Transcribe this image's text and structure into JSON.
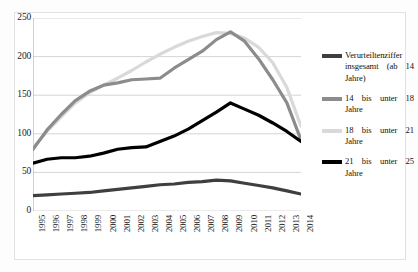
{
  "chart_data": {
    "type": "line",
    "title": "",
    "subtitle": "",
    "xlabel": "",
    "ylabel": "",
    "x": [
      1995,
      1996,
      1997,
      1998,
      1999,
      2000,
      2001,
      2002,
      2003,
      2004,
      2005,
      2006,
      2007,
      2008,
      2009,
      2010,
      2011,
      2012,
      2013,
      2014
    ],
    "categories": [
      "1995",
      "1996",
      "1997",
      "1998",
      "1999",
      "2000",
      "2001",
      "2002",
      "2003",
      "2004",
      "2005",
      "2006",
      "2007",
      "2008",
      "2009",
      "2010",
      "2011",
      "2012",
      "2013",
      "2014"
    ],
    "xlim": [
      1995,
      2014
    ],
    "ylim": [
      0,
      250
    ],
    "yticks": [
      0,
      50,
      100,
      150,
      200,
      250
    ],
    "ytick_labels": [
      "0",
      "50",
      "100",
      "150",
      "200",
      "250"
    ],
    "grid": "horizontal",
    "legend_position": "right",
    "series": [
      {
        "name": "Verurteiltenziffer insgesamt (ab 14 Jahre)",
        "color": "#3f3f3f",
        "width": 3.2,
        "values": [
          20,
          21,
          22,
          23,
          24,
          26,
          28,
          30,
          32,
          34,
          35,
          37,
          38,
          40,
          39,
          36,
          33,
          30,
          26,
          22
        ]
      },
      {
        "name": "14 bis unter 18 Jahre",
        "color": "#8c8c8c",
        "width": 3.2,
        "values": [
          80,
          105,
          125,
          143,
          155,
          163,
          166,
          170,
          171,
          172,
          185,
          196,
          207,
          222,
          232,
          220,
          197,
          170,
          140,
          92
        ]
      },
      {
        "name": "18 bis unter 21 Jahre",
        "color": "#d9d9d9",
        "width": 3.2,
        "values": [
          82,
          103,
          122,
          140,
          153,
          163,
          172,
          182,
          193,
          203,
          212,
          220,
          226,
          231,
          230,
          224,
          212,
          192,
          160,
          110
        ]
      },
      {
        "name": "21 bis unter 25 Jahre",
        "color": "#000000",
        "width": 3.2,
        "values": [
          62,
          67,
          69,
          69,
          71,
          75,
          80,
          82,
          83,
          90,
          97,
          106,
          117,
          128,
          140,
          132,
          124,
          114,
          103,
          90
        ]
      }
    ]
  },
  "legend": {
    "entries": [
      {
        "label": "Verurteiltenziffer insgesamt (ab 14 Jahre)",
        "swatch": "#3f3f3f"
      },
      {
        "label": "14 bis unter 18 Jahre",
        "swatch": "#8c8c8c"
      },
      {
        "label": "18 bis unter 21 Jahre",
        "swatch": "#d9d9d9"
      },
      {
        "label": "21 bis unter 25 Jahre",
        "swatch": "#000000"
      }
    ]
  }
}
